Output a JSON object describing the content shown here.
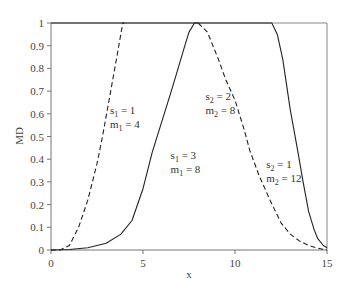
{
  "chart_data": {
    "type": "line",
    "title": "",
    "xlabel": "x",
    "ylabel": "MD",
    "xlim": [
      0,
      15
    ],
    "ylim": [
      0,
      1
    ],
    "grid": false,
    "legend": "none (inline annotations)",
    "x_ticks": [
      0,
      5,
      10,
      15
    ],
    "y_ticks": [
      0,
      0.1,
      0.2,
      0.3,
      0.4,
      0.5,
      0.6,
      0.7,
      0.8,
      0.9,
      1
    ],
    "series": [
      {
        "name": "left dashed (s1 = 1, m1 = 4)",
        "style": "dashed",
        "points": [
          [
            0,
            0
          ],
          [
            0.5,
            0
          ],
          [
            1,
            0.02
          ],
          [
            1.5,
            0.1
          ],
          [
            2,
            0.22
          ],
          [
            2.5,
            0.38
          ],
          [
            2.8,
            0.5
          ],
          [
            3.2,
            0.68
          ],
          [
            3.6,
            0.86
          ],
          [
            3.9,
            1
          ],
          [
            4,
            1
          ]
        ]
      },
      {
        "name": "left solid (s1 = 3, m1 = 8)",
        "style": "solid",
        "points": [
          [
            0,
            0
          ],
          [
            1,
            0.002
          ],
          [
            2,
            0.01
          ],
          [
            3,
            0.03
          ],
          [
            3.8,
            0.07
          ],
          [
            4.4,
            0.13
          ],
          [
            5,
            0.27
          ],
          [
            5.5,
            0.43
          ],
          [
            6,
            0.56
          ],
          [
            6.5,
            0.69
          ],
          [
            6.8,
            0.77
          ],
          [
            7.2,
            0.88
          ],
          [
            7.5,
            0.96
          ],
          [
            7.8,
            1
          ],
          [
            8,
            1
          ]
        ]
      },
      {
        "name": "right dashed (s2 = 2, m2 = 8)",
        "style": "dashed",
        "points": [
          [
            8,
            1
          ],
          [
            8.5,
            0.96
          ],
          [
            9.1,
            0.84
          ],
          [
            9.5,
            0.75
          ],
          [
            10,
            0.66
          ],
          [
            10.5,
            0.53
          ],
          [
            10.8,
            0.44
          ],
          [
            11.3,
            0.33
          ],
          [
            11.9,
            0.22
          ],
          [
            12.5,
            0.12
          ],
          [
            13,
            0.07
          ],
          [
            13.5,
            0.04
          ],
          [
            14,
            0.02
          ],
          [
            14.5,
            0.008
          ],
          [
            15,
            0
          ]
        ]
      },
      {
        "name": "right solid (s2 = 1, m2 = 12)",
        "style": "solid",
        "points": [
          [
            0,
            1
          ],
          [
            12,
            1
          ],
          [
            12.3,
            0.95
          ],
          [
            12.6,
            0.84
          ],
          [
            13,
            0.62
          ],
          [
            13.4,
            0.44
          ],
          [
            13.7,
            0.3
          ],
          [
            14,
            0.17
          ],
          [
            14.3,
            0.09
          ],
          [
            14.5,
            0.05
          ],
          [
            14.8,
            0.02
          ],
          [
            15,
            0.01
          ]
        ]
      }
    ],
    "annotations": [
      {
        "line1": "s1 = 1",
        "line2": "m1 = 4",
        "x": 3.2,
        "y": 0.6
      },
      {
        "line1": "s1 = 3",
        "line2": "m1 = 8",
        "x": 6.5,
        "y": 0.4
      },
      {
        "line1": "s2 = 2",
        "line2": "m2 = 8",
        "x": 8.4,
        "y": 0.66
      },
      {
        "line1": "s2 = 1",
        "line2": "m2 = 12",
        "x": 11.7,
        "y": 0.36
      }
    ]
  },
  "labels": {
    "xlabel": "x",
    "ylabel": "MD",
    "x_ticks": [
      "0",
      "5",
      "10",
      "15"
    ],
    "y_ticks": [
      "0",
      "0.1",
      "0.2",
      "0.3",
      "0.4",
      "0.5",
      "0.6",
      "0.7",
      "0.8",
      "0.9",
      "1"
    ],
    "annot": [
      {
        "s": "s",
        "ssub": "1",
        "sval": " = 1",
        "m": "m",
        "msub": "1",
        "mval": " = 4"
      },
      {
        "s": "s",
        "ssub": "1",
        "sval": " = 3",
        "m": "m",
        "msub": "1",
        "mval": " = 8"
      },
      {
        "s": "s",
        "ssub": "2",
        "sval": " = 2",
        "m": "m",
        "msub": "2",
        "mval": " = 8"
      },
      {
        "s": "s",
        "ssub": "2",
        "sval": " = 1",
        "m": "m",
        "msub": "2",
        "mval": " = 12"
      }
    ]
  }
}
